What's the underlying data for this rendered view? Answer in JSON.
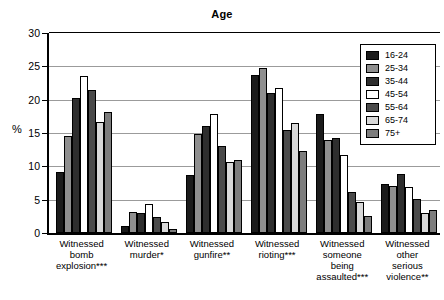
{
  "chart_data": {
    "type": "bar",
    "title": "Age",
    "xlabel": "",
    "ylabel": "%",
    "ylim": [
      0,
      30
    ],
    "yticks": [
      0,
      5,
      10,
      15,
      20,
      25,
      30
    ],
    "grid": true,
    "legend_position": "top-right",
    "categories": [
      "Witnessed bomb explosion***",
      "Witnessed murder*",
      "Witnessed gunfire**",
      "Witnessed rioting***",
      "Witnessed someone being assaulted***",
      "Witnessed other serious violence**"
    ],
    "category_lines": [
      [
        "Witnessed",
        "bomb",
        "explosion***"
      ],
      [
        "Witnessed",
        "murder*"
      ],
      [
        "Witnessed",
        "gunfire**"
      ],
      [
        "Witnessed",
        "rioting***"
      ],
      [
        "Witnessed",
        "someone",
        "being",
        "assaulted***"
      ],
      [
        "Witnessed",
        "other",
        "serious",
        "violence**"
      ]
    ],
    "series": [
      {
        "name": "16-24",
        "color": "#1b1b1b",
        "values": [
          9.2,
          1.1,
          8.7,
          23.7,
          17.9,
          7.4
        ]
      },
      {
        "name": "25-34",
        "color": "#8f8f8f",
        "values": [
          14.5,
          3.2,
          14.8,
          24.8,
          13.9,
          7.0
        ]
      },
      {
        "name": "35-44",
        "color": "#2e2e2e",
        "values": [
          20.3,
          3.0,
          16.0,
          21.0,
          14.2,
          8.9
        ]
      },
      {
        "name": "45-54",
        "color": "#ffffff",
        "values": [
          23.5,
          4.3,
          17.8,
          21.8,
          11.7,
          6.9
        ]
      },
      {
        "name": "55-64",
        "color": "#4a4a4a",
        "values": [
          21.4,
          2.4,
          13.0,
          15.5,
          6.2,
          5.1
        ]
      },
      {
        "name": "65-74",
        "color": "#d8d8d8",
        "values": [
          16.6,
          1.7,
          10.7,
          16.5,
          4.6,
          3.0
        ]
      },
      {
        "name": "75+",
        "color": "#7d7d7d",
        "values": [
          18.1,
          0.6,
          10.9,
          12.3,
          2.6,
          3.5
        ]
      }
    ]
  }
}
